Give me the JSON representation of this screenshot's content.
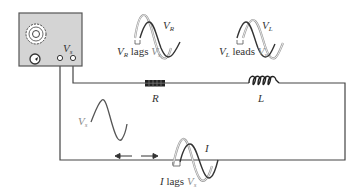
{
  "diagram": {
    "type": "series RL circuit with oscilloscope",
    "colors": {
      "wire": "#444444",
      "scope_fill": "#d4d4d4",
      "scope_border": "#555555",
      "wave_dark": "#333333",
      "wave_light": "#9a9a9a",
      "background": "#ffffff"
    },
    "oscilloscope": {
      "label": "V",
      "label_sub": "s",
      "knob_icon": "dial-knob",
      "gauge_icon": "meter-dial"
    },
    "components": {
      "resistor": {
        "label": "R"
      },
      "inductor": {
        "label": "L"
      }
    },
    "source_wave": {
      "label": "V",
      "label_sub": "s",
      "arrows": "double-headed-arrow"
    },
    "annotations": {
      "resistor_wave": {
        "top_label": "V",
        "top_label_sub": "R",
        "caption_main": "V",
        "caption_main_sub": "R",
        "caption_text": " lags ",
        "caption_ref": "V",
        "caption_ref_sub": "s"
      },
      "inductor_wave": {
        "top_label": "V",
        "top_label_sub": "L",
        "caption_main": "V",
        "caption_main_sub": "L",
        "caption_text": " leads ",
        "caption_ref": "V",
        "caption_ref_sub": "s"
      },
      "current_wave": {
        "top_label": "I",
        "caption_main": "I",
        "caption_text": " lags ",
        "caption_ref": "V",
        "caption_ref_sub": "s"
      }
    }
  }
}
